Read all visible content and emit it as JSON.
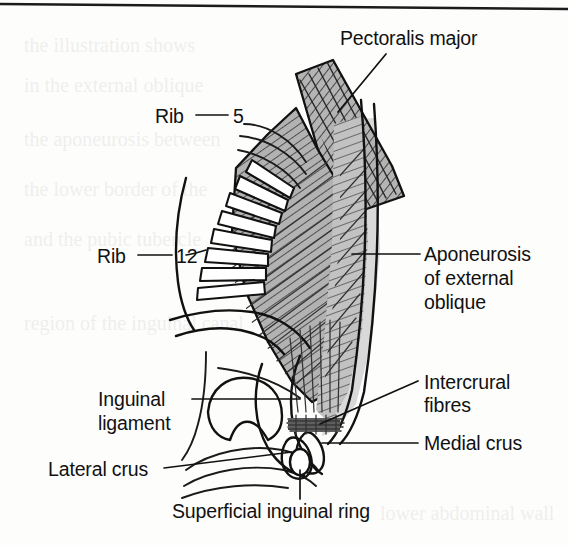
{
  "figure": {
    "page_rule_present": true,
    "background_color": "#fdfdfc",
    "ink_color": "#111111",
    "muscle_fill_color": "#b2b2b2",
    "aponeurosis_fill_color": "#c4c4c4",
    "shadow_fill_color": "#cfcfcf"
  },
  "labels": {
    "pectoralis_major": "Pectoralis major",
    "rib_word_upper": "Rib",
    "rib_number_upper": "5",
    "rib_word_lower": "Rib",
    "rib_number_lower": "12",
    "aponeurosis_line1": "Aponeurosis",
    "aponeurosis_line2": "of external",
    "aponeurosis_line3": "oblique",
    "intercrural_line1": "Intercrural",
    "intercrural_line2": "fibres",
    "medial_crus": "Medial crus",
    "inguinal_line1": "Inguinal",
    "inguinal_line2": "ligament",
    "lateral_crus": "Lateral crus",
    "superficial_inguinal_ring": "Superficial inguinal ring"
  },
  "structures": [
    {
      "name": "pectoralis-major",
      "label": "Pectoralis major",
      "fill": "#b2b2b2",
      "hatch": "diagonal"
    },
    {
      "name": "external-oblique-muscle",
      "label": "External oblique",
      "fill": "#b2b2b2",
      "hatch": "diagonal"
    },
    {
      "name": "aponeurosis-of-external-oblique",
      "label": "Aponeurosis of external oblique",
      "fill": "#c4c4c4",
      "hatch": "diagonal"
    },
    {
      "name": "ribs",
      "label": "Ribs 5 to 12",
      "fill": "#ffffff",
      "hatch": "none",
      "count": 8
    },
    {
      "name": "intercrural-fibres",
      "label": "Intercrural fibres",
      "fill": "#111111",
      "hatch": "horizontal"
    },
    {
      "name": "medial-crus",
      "label": "Medial crus",
      "fill": "#ffffff",
      "hatch": "none"
    },
    {
      "name": "lateral-crus",
      "label": "Lateral crus",
      "fill": "#ffffff",
      "hatch": "none"
    },
    {
      "name": "inguinal-ligament",
      "label": "Inguinal ligament",
      "fill": "none",
      "hatch": "none"
    },
    {
      "name": "superficial-inguinal-ring",
      "label": "Superficial inguinal ring",
      "fill": "#ffffff",
      "hatch": "none"
    }
  ],
  "bleed_through_lines": [
    "the illustration shows",
    "in the external oblique",
    "the aponeurosis between",
    "the lower border of the",
    "and the pubic tubercle",
    "region of the inguinal canal"
  ]
}
